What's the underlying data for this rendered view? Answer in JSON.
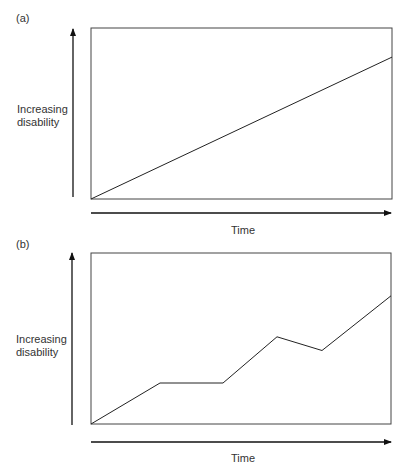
{
  "chart_data": [
    {
      "type": "line",
      "panel": "(a)",
      "title": "",
      "xlabel": "Time",
      "ylabel": "Increasing disability",
      "grid": false,
      "legend": null,
      "x": [
        0,
        1
      ],
      "series": [
        {
          "name": "disability",
          "values": [
            0,
            0.83
          ]
        }
      ],
      "ylim": [
        0,
        1
      ],
      "xlim": [
        0,
        1
      ]
    },
    {
      "type": "line",
      "panel": "(b)",
      "title": "",
      "xlabel": "Time",
      "ylabel": "Increasing disability",
      "grid": false,
      "legend": null,
      "x": [
        0,
        0.23,
        0.44,
        0.62,
        0.77,
        1
      ],
      "series": [
        {
          "name": "disability",
          "values": [
            0,
            0.24,
            0.24,
            0.51,
            0.43,
            0.75
          ]
        }
      ],
      "ylim": [
        0,
        1
      ],
      "xlim": [
        0,
        1
      ]
    }
  ],
  "panels": {
    "a": {
      "label": "(a)",
      "ylabel_line1": "Increasing",
      "ylabel_line2": "disability",
      "xlabel": "Time"
    },
    "b": {
      "label": "(b)",
      "ylabel_line1": "Increasing",
      "ylabel_line2": "disability",
      "xlabel": "Time"
    }
  }
}
